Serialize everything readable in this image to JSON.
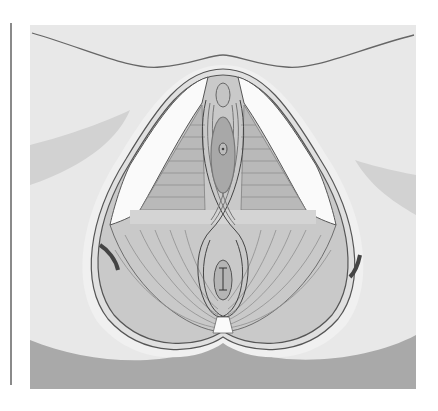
{
  "figure": {
    "style": "grayscale",
    "labels": []
  },
  "colors": {
    "background": "#e6e6e6",
    "skin_light": "#ececec",
    "shadow": "#c8c8c8",
    "buttock_shadow": "#a9a9a9",
    "muscle": "#c9c9c9",
    "muscle_dark": "#a8a8a8",
    "outline": "#555555",
    "white_fat": "#fafafa",
    "rule": "#8a8a8a"
  }
}
